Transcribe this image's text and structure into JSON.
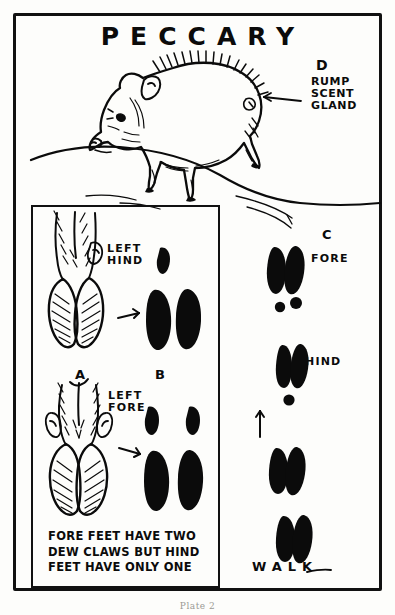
{
  "plate": {
    "title": "PECCARY",
    "footer": "Plate 2"
  },
  "animal": {
    "name": "peccary",
    "pose": "walking left profile on ground line"
  },
  "callouts": {
    "d_letter": "D",
    "d_label": "RUMP\nSCENT\nGLAND",
    "c_letter": "C",
    "a_letter": "A",
    "b_letter": "B"
  },
  "inset": {
    "hind_label": "LEFT\nHIND",
    "fore_label": "LEFT\nFORE",
    "caption": "FORE FEET HAVE TWO\nDEW CLAWS BUT HIND\nFEET HAVE ONLY ONE"
  },
  "trackway": {
    "fore_label": "FORE",
    "hind_label": "HIND",
    "gait_label": "WALK",
    "direction": "up"
  },
  "colors": {
    "ink": "#0b0b0b",
    "paper": "#fdfdfb"
  }
}
